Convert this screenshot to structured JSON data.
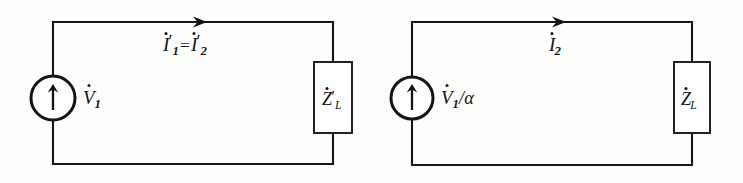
{
  "figure": {
    "background_color": "#fdfdfc",
    "line_color": "#161616",
    "circuits": [
      {
        "id": "circuit-left",
        "source": {
          "type": "voltage-source",
          "symbol": "arrow-up",
          "label_main": "V",
          "label_dot": true,
          "label_sub": "1",
          "label_suffix": ""
        },
        "current": {
          "first_main": "I",
          "first_sub": "1",
          "first_prime": "′",
          "equals": "=",
          "second_main": "I",
          "second_sub": "2",
          "second_prime": "′",
          "arrow_direction": "right"
        },
        "impedance": {
          "label_main": "Z",
          "label_dot": true,
          "label_sub": "L",
          "label_prime": "′"
        }
      },
      {
        "id": "circuit-right",
        "source": {
          "type": "voltage-source",
          "symbol": "arrow-up",
          "label_main": "V",
          "label_dot": true,
          "label_sub": "1",
          "label_suffix": "/α"
        },
        "current": {
          "first_main": "I",
          "first_sub": "2",
          "first_prime": "",
          "equals": "",
          "second_main": "",
          "second_sub": "",
          "second_prime": "",
          "arrow_direction": "right"
        },
        "impedance": {
          "label_main": "Z",
          "label_dot": true,
          "label_sub": "L",
          "label_prime": ""
        }
      }
    ]
  }
}
